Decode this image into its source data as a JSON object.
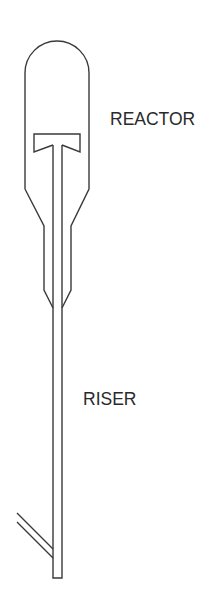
{
  "diagram": {
    "type": "process-schematic",
    "labels": {
      "reactor": "REACTOR",
      "riser": "RISER"
    },
    "components": [
      {
        "id": "reactor-vessel",
        "label": "REACTOR"
      },
      {
        "id": "riser-pipe",
        "label": "RISER"
      },
      {
        "id": "t-deflector",
        "label": ""
      },
      {
        "id": "side-inlet",
        "label": ""
      }
    ],
    "colors": {
      "line": "#3a3a3a",
      "text": "#2a2a2a",
      "background": "#ffffff"
    }
  }
}
